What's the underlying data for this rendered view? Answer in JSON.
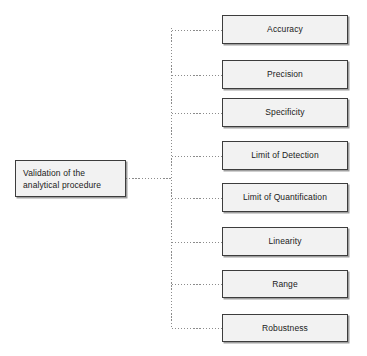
{
  "diagram": {
    "root": {
      "id": "validation-root",
      "label": "Validation of the\nanalytical procedure",
      "x": 15,
      "y": 160,
      "width": 111,
      "height": 37
    },
    "trunk": {
      "x": 171,
      "top": 28,
      "bottom": 328,
      "stub_from_x": 126,
      "stub_y": 178,
      "color": "#8c8c8c",
      "style": "dotted"
    },
    "branch_gap_x": 51,
    "nodes": [
      {
        "id": "accuracy",
        "label": "Accuracy",
        "x": 222,
        "y": 15,
        "width": 126,
        "height": 29
      },
      {
        "id": "precision",
        "label": "Precision",
        "x": 222,
        "y": 60,
        "width": 126,
        "height": 29
      },
      {
        "id": "specificity",
        "label": "Specificity",
        "x": 222,
        "y": 98,
        "width": 126,
        "height": 29
      },
      {
        "id": "limit-of-detection",
        "label": "Limit of Detection",
        "x": 222,
        "y": 141,
        "width": 126,
        "height": 29
      },
      {
        "id": "limit-of-quantification",
        "label": "Limit of Quantification",
        "x": 222,
        "y": 183,
        "width": 126,
        "height": 29
      },
      {
        "id": "linearity",
        "label": "Linearity",
        "x": 222,
        "y": 227,
        "width": 126,
        "height": 29
      },
      {
        "id": "range",
        "label": "Range",
        "x": 222,
        "y": 270,
        "width": 126,
        "height": 28
      },
      {
        "id": "robustness",
        "label": "Robustness",
        "x": 222,
        "y": 314,
        "width": 126,
        "height": 28
      }
    ],
    "colors": {
      "node_fill": "#f2f2f2",
      "node_border": "#3d3d3d",
      "connector": "#8c8c8c",
      "text": "#1a1a1a",
      "background": "#ffffff"
    }
  }
}
